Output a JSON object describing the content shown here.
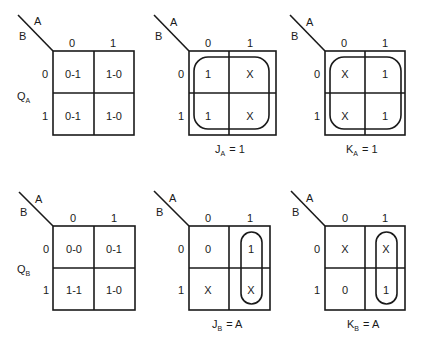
{
  "axis_labels": {
    "column_var": "A",
    "row_var": "B",
    "column_values": [
      "0",
      "1"
    ],
    "row_values": [
      "0",
      "1"
    ]
  },
  "maps": [
    {
      "id": "qa-transition",
      "side_label": "Q",
      "side_sub": "A",
      "cells": [
        [
          "0-1",
          "1-0"
        ],
        [
          "0-1",
          "1-0"
        ]
      ],
      "caption_main": "",
      "caption_sub": "",
      "caption_rhs": ""
    },
    {
      "id": "ja-map",
      "side_label": "",
      "side_sub": "",
      "cells": [
        [
          "1",
          "X"
        ],
        [
          "1",
          "X"
        ]
      ],
      "caption_main": "J",
      "caption_sub": "A",
      "caption_rhs": "= 1"
    },
    {
      "id": "ka-map",
      "side_label": "",
      "side_sub": "",
      "cells": [
        [
          "X",
          "1"
        ],
        [
          "X",
          "1"
        ]
      ],
      "caption_main": "K",
      "caption_sub": "A",
      "caption_rhs": "= 1"
    },
    {
      "id": "qb-transition",
      "side_label": "Q",
      "side_sub": "B",
      "cells": [
        [
          "0-0",
          "0-1"
        ],
        [
          "1-1",
          "1-0"
        ]
      ],
      "caption_main": "",
      "caption_sub": "",
      "caption_rhs": ""
    },
    {
      "id": "jb-map",
      "side_label": "",
      "side_sub": "",
      "cells": [
        [
          "0",
          "1"
        ],
        [
          "X",
          "X"
        ]
      ],
      "caption_main": "J",
      "caption_sub": "B",
      "caption_rhs": "= A"
    },
    {
      "id": "kb-map",
      "side_label": "",
      "side_sub": "",
      "cells": [
        [
          "X",
          "X"
        ],
        [
          "0",
          "1"
        ]
      ],
      "caption_main": "K",
      "caption_sub": "B",
      "caption_rhs": "= A"
    }
  ]
}
